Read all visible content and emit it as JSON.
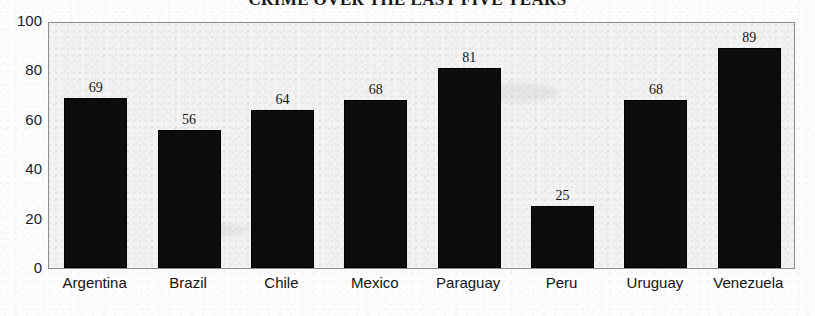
{
  "chart_data": {
    "type": "bar",
    "title": "CRIME OVER THE LAST FIVE YEARS",
    "xlabel": "",
    "ylabel": "",
    "categories": [
      "Argentina",
      "Brazil",
      "Chile",
      "Mexico",
      "Paraguay",
      "Peru",
      "Uruguay",
      "Venezuela"
    ],
    "values": [
      69,
      56,
      64,
      68,
      81,
      25,
      68,
      89
    ],
    "value_labels": [
      "69",
      "56",
      "64",
      "68",
      "81",
      "25",
      "68",
      "89"
    ],
    "ylim": [
      0,
      100
    ],
    "ytick_labels": [
      "0",
      "20",
      "40",
      "60",
      "80",
      "100"
    ],
    "ytick_values": [
      0,
      20,
      40,
      60,
      80,
      100
    ],
    "grid": false,
    "legend": "none",
    "bar_color": "#0d0d0d",
    "plot_background_color": "#f3f3f3",
    "frame_color": "#8d8d8d"
  }
}
